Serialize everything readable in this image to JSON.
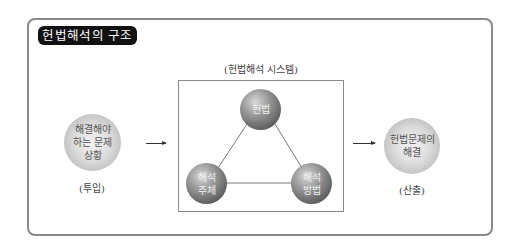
{
  "title": "헌법해석의 구조",
  "system": {
    "label": "(헌법해석 시스템)",
    "nodes": [
      {
        "id": "constitution",
        "label": "헌법"
      },
      {
        "id": "subject",
        "label_line1": "해석",
        "label_line2": "주체"
      },
      {
        "id": "method",
        "label_line1": "해석",
        "label_line2": "방법"
      }
    ]
  },
  "input": {
    "line1": "해결해야",
    "line2": "하는 문제",
    "line3": "상황",
    "caption": "(투입)"
  },
  "output": {
    "line1": "헌법문제의",
    "line2": "해결",
    "caption": "(산출)"
  }
}
